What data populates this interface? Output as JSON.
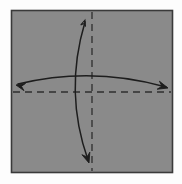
{
  "canvas": {
    "width": 182,
    "height": 184,
    "background_color": "#fdfdfd"
  },
  "diagram": {
    "kind": "origami-fold-instruction",
    "paper": {
      "name": "square-paper",
      "x": 11,
      "y": 10,
      "width": 161,
      "height": 162,
      "fill_color": "#8a8a8a",
      "border_color": "#3a3a3a",
      "border_width": 1.6
    },
    "fold_lines": [
      {
        "name": "vertical-fold-line",
        "orientation": "vertical",
        "x1": 92,
        "y1": 12,
        "x2": 92,
        "y2": 171,
        "style": "dashed",
        "dash_pattern": "7,5",
        "color": "#2f2f2f",
        "width": 1.3
      },
      {
        "name": "horizontal-fold-line",
        "orientation": "horizontal",
        "x1": 13,
        "y1": 92,
        "x2": 171,
        "y2": 92,
        "style": "dashed",
        "dash_pattern": "7,5",
        "color": "#2f2f2f",
        "width": 1.3
      }
    ],
    "arrows": [
      {
        "name": "horizontal-fold-arrow",
        "description": "wide arc spanning left to right, bowing upward, arrowheads at both ends",
        "path": "M 18 84 Q 92 66 166 87",
        "color": "#1d1d1d",
        "width": 1.5,
        "start_head": {
          "name": "left-arrowhead",
          "x": 16,
          "y": 85,
          "angle_deg": 193,
          "style": "filled-triangle",
          "size": 8
        },
        "end_head": {
          "name": "right-arrowhead",
          "x": 168,
          "y": 88,
          "angle_deg": 16,
          "style": "filled-triangle",
          "size": 9
        }
      },
      {
        "name": "vertical-fold-arrow",
        "description": "tall arc from top down to bottom, bowing to the left, arrowheads at both ends",
        "path": "M 85 22 Q 64 92 88 160",
        "color": "#1d1d1d",
        "width": 1.5,
        "start_head": {
          "name": "top-arrowhead",
          "x": 85,
          "y": 20,
          "angle_deg": -72,
          "style": "open-triangle",
          "size": 6
        },
        "end_head": {
          "name": "bottom-arrowhead",
          "x": 89,
          "y": 163,
          "angle_deg": 72,
          "style": "filled-triangle",
          "size": 9
        }
      }
    ]
  }
}
